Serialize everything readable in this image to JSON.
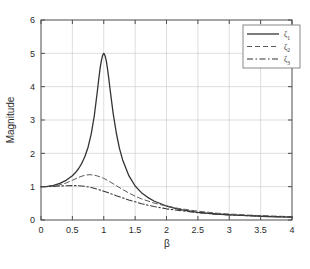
{
  "chart_data": {
    "type": "line",
    "title": "",
    "xlabel": "β",
    "ylabel": "Magnitude",
    "xlim": [
      0,
      4
    ],
    "ylim": [
      0,
      6
    ],
    "grid": true,
    "legend_position": "top-right",
    "xticks": [
      "0",
      "0.5",
      "1",
      "1.5",
      "2",
      "2.5",
      "3",
      "3.5",
      "4"
    ],
    "xtick_values": [
      0,
      0.5,
      1,
      1.5,
      2,
      2.5,
      3,
      3.5,
      4
    ],
    "yticks": [
      "0",
      "1",
      "2",
      "3",
      "4",
      "5",
      "6"
    ],
    "ytick_values": [
      0,
      1,
      2,
      3,
      4,
      5,
      6
    ],
    "series": [
      {
        "name": "ζ",
        "subscript": "1",
        "style": "solid",
        "damping_ratio": 0.1,
        "peak_x": 1.0,
        "peak_y": 5.0,
        "x": [
          0,
          0.1,
          0.2,
          0.3,
          0.4,
          0.5,
          0.55,
          0.6,
          0.65,
          0.7,
          0.75,
          0.8,
          0.85,
          0.9,
          0.92,
          0.94,
          0.96,
          0.98,
          0.99,
          1.0,
          1.01,
          1.02,
          1.04,
          1.06,
          1.08,
          1.1,
          1.15,
          1.2,
          1.25,
          1.3,
          1.4,
          1.5,
          1.6,
          1.7,
          1.8,
          2.0,
          2.2,
          2.5,
          2.8,
          3.0,
          3.3,
          3.6,
          4.0
        ],
        "values": [
          1.0,
          1.01,
          1.042,
          1.099,
          1.19,
          1.329,
          1.424,
          1.545,
          1.7,
          1.905,
          2.185,
          2.577,
          3.135,
          3.893,
          4.222,
          4.525,
          4.757,
          4.93,
          4.97,
          5.0,
          4.975,
          4.93,
          4.78,
          4.53,
          4.25,
          3.93,
          3.2,
          2.61,
          2.15,
          1.81,
          1.33,
          1.02,
          0.82,
          0.68,
          0.57,
          0.42,
          0.32,
          0.23,
          0.18,
          0.155,
          0.13,
          0.105,
          0.085
        ]
      },
      {
        "name": "ζ",
        "subscript": "2",
        "style": "dashed",
        "damping_ratio": 0.4,
        "peak_x": 0.78,
        "peak_y": 1.36,
        "x": [
          0,
          0.1,
          0.2,
          0.3,
          0.4,
          0.5,
          0.6,
          0.7,
          0.78,
          0.85,
          0.9,
          1.0,
          1.1,
          1.2,
          1.3,
          1.4,
          1.5,
          1.6,
          1.8,
          2.0,
          2.2,
          2.5,
          2.8,
          3.0,
          3.3,
          3.6,
          4.0
        ],
        "values": [
          1.0,
          1.004,
          1.02,
          1.055,
          1.11,
          1.19,
          1.28,
          1.345,
          1.36,
          1.345,
          1.32,
          1.25,
          1.145,
          1.03,
          0.915,
          0.81,
          0.715,
          0.635,
          0.51,
          0.415,
          0.345,
          0.265,
          0.205,
          0.18,
          0.148,
          0.124,
          0.1
        ]
      },
      {
        "name": "ζ",
        "subscript": "3",
        "style": "dash-dot",
        "damping_ratio": 0.6,
        "peak_x": 0.55,
        "peak_y": 1.03,
        "x": [
          0,
          0.1,
          0.2,
          0.3,
          0.4,
          0.5,
          0.55,
          0.6,
          0.7,
          0.8,
          0.9,
          1.0,
          1.1,
          1.2,
          1.3,
          1.4,
          1.5,
          1.6,
          1.8,
          2.0,
          2.2,
          2.5,
          2.8,
          3.0,
          3.3,
          3.6,
          4.0
        ],
        "values": [
          1.0,
          1.002,
          1.01,
          1.02,
          1.028,
          1.032,
          1.031,
          1.028,
          1.01,
          0.975,
          0.925,
          0.865,
          0.8,
          0.73,
          0.665,
          0.6,
          0.545,
          0.49,
          0.405,
          0.335,
          0.285,
          0.22,
          0.175,
          0.155,
          0.128,
          0.108,
          0.088
        ]
      }
    ]
  },
  "legend": {
    "entries": [
      {
        "label": "ζ",
        "subscript": "1",
        "style": "solid"
      },
      {
        "label": "ζ",
        "subscript": "2",
        "style": "dashed"
      },
      {
        "label": "ζ",
        "subscript": "3",
        "style": "dash-dot"
      }
    ]
  }
}
